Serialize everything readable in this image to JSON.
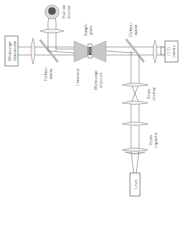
{
  "diagram": {
    "orientation": "rotated-90",
    "components": [
      {
        "id": "microscope-illumination",
        "label_line1": "Microscope",
        "label_line2": "illumination"
      },
      {
        "id": "position-detector",
        "label_line1": "Position",
        "label_line2": "detector"
      },
      {
        "id": "dichroic-mirror-left",
        "label_line1": "Dichroic",
        "label_line2": "mirror"
      },
      {
        "id": "condenser",
        "label_line1": "Condenser",
        "label_line2": ""
      },
      {
        "id": "sample-plane",
        "label_line1": "Sample",
        "label_line2": "plane"
      },
      {
        "id": "microscope-objective",
        "label_line1": "Microscope",
        "label_line2": "objective"
      },
      {
        "id": "dichroic-mirror-right",
        "label_line1": "Dichroic",
        "label_line2": "mirror"
      },
      {
        "id": "ccd-camera",
        "label_line1": "CCD",
        "label_line2": "camera"
      },
      {
        "id": "beam-steering",
        "label_line1": "Beam",
        "label_line2": "steering"
      },
      {
        "id": "beam-expander",
        "label_line1": "Beam",
        "label_line2": "expander"
      },
      {
        "id": "laser",
        "label_line1": "Laser",
        "label_line2": ""
      }
    ]
  }
}
